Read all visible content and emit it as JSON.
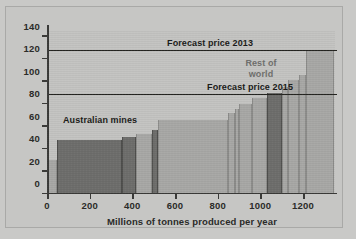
{
  "chart_data": {
    "type": "bar",
    "title": "",
    "subtitle": "",
    "xlabel": "Millions of tonnes produced per year",
    "ylabel": "",
    "xlim": [
      0,
      1350
    ],
    "ylim": [
      0,
      145
    ],
    "grid": false,
    "legend_position": "in-plot annotations",
    "x_ticks": [
      0,
      200,
      400,
      600,
      800,
      1000,
      1200
    ],
    "x_tick_labels": [
      "0",
      "200",
      "400",
      "600",
      "800",
      "1000",
      "1200"
    ],
    "y_ticks": [
      0,
      20,
      40,
      60,
      80,
      100,
      120,
      140
    ],
    "y_tick_labels": [
      "0",
      "20",
      "40",
      "60",
      "80",
      "100",
      "120",
      "140"
    ],
    "annotations": [
      {
        "name": "australian-mines",
        "text": "Australian mines",
        "color": "#1b1b19"
      },
      {
        "name": "rest-of-world",
        "text": "Rest of\nworld",
        "line1": "Rest of",
        "line2": "world",
        "color": "#6f6f6d"
      }
    ],
    "reference_lines": [
      {
        "name": "forecast-price-2013",
        "label": "Forecast price 2013",
        "value": 127,
        "color": "#23231f"
      },
      {
        "name": "forecast-price-2015",
        "label": "Forecast price 2015",
        "value": 88,
        "color": "#23231f"
      }
    ],
    "series": [
      {
        "name": "Australian mines",
        "color": "#6e6e6c"
      },
      {
        "name": "Rest of world",
        "color": "#a8a8a6"
      }
    ],
    "bars": [
      {
        "group": "Rest of world",
        "x_start": 0,
        "x_end": 48,
        "value": 30
      },
      {
        "group": "Australian mines",
        "x_start": 48,
        "x_end": 350,
        "value": 48
      },
      {
        "group": "Australian mines",
        "x_start": 350,
        "x_end": 415,
        "value": 51
      },
      {
        "group": "Rest of world",
        "x_start": 415,
        "x_end": 490,
        "value": 53
      },
      {
        "group": "Australian mines",
        "x_start": 490,
        "x_end": 520,
        "value": 57
      },
      {
        "group": "Rest of world",
        "x_start": 520,
        "x_end": 850,
        "value": 66
      },
      {
        "group": "Rest of world",
        "x_start": 850,
        "x_end": 880,
        "value": 72
      },
      {
        "group": "Rest of world",
        "x_start": 880,
        "x_end": 900,
        "value": 76
      },
      {
        "group": "Rest of world",
        "x_start": 900,
        "x_end": 960,
        "value": 80
      },
      {
        "group": "Rest of world",
        "x_start": 960,
        "x_end": 1030,
        "value": 85
      },
      {
        "group": "Australian mines",
        "x_start": 1030,
        "x_end": 1100,
        "value": 90
      },
      {
        "group": "Rest of world",
        "x_start": 1100,
        "x_end": 1130,
        "value": 95
      },
      {
        "group": "Rest of world",
        "x_start": 1130,
        "x_end": 1180,
        "value": 101
      },
      {
        "group": "Rest of world",
        "x_start": 1180,
        "x_end": 1215,
        "value": 106
      },
      {
        "group": "Rest of world",
        "x_start": 1215,
        "x_end": 1345,
        "value": 127
      }
    ]
  }
}
